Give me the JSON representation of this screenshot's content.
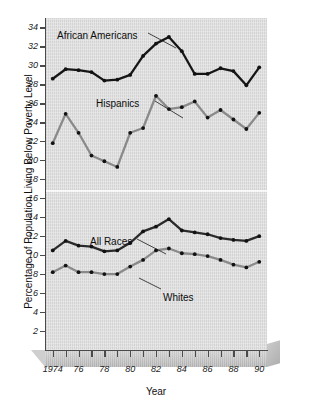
{
  "chart_data": {
    "type": "line",
    "title": "",
    "xlabel": "Year",
    "ylabel": "Percentage of Population Living Below Poverty Level",
    "x": [
      1974,
      1975,
      1976,
      1977,
      1978,
      1979,
      1980,
      1981,
      1982,
      1983,
      1984,
      1985,
      1986,
      1987,
      1988,
      1989,
      1990
    ],
    "xtick_labels": [
      "1974",
      "76",
      "78",
      "80",
      "82",
      "84",
      "86",
      "88",
      "90"
    ],
    "xtick_values": [
      1974,
      1976,
      1978,
      1980,
      1982,
      1984,
      1986,
      1988,
      1990
    ],
    "ytick_labels": [
      "2",
      "4",
      "6",
      "8",
      "10",
      "12",
      "14",
      "16",
      "18",
      "20",
      "22",
      "24",
      "26",
      "28",
      "30",
      "32",
      "34"
    ],
    "ytick_values": [
      2,
      4,
      6,
      8,
      10,
      12,
      14,
      16,
      18,
      20,
      22,
      24,
      26,
      28,
      30,
      32,
      34
    ],
    "ylim": [
      0,
      35
    ],
    "xlim": [
      1973.4,
      1990.6
    ],
    "grid": false,
    "legend_position": "inline-annotations",
    "series": [
      {
        "name": "African Americans",
        "color": "#161616",
        "values": [
          28.6,
          29.6,
          29.5,
          29.3,
          28.4,
          28.5,
          29.0,
          31.0,
          32.3,
          33.0,
          31.5,
          29.1,
          29.1,
          29.7,
          29.4,
          27.9,
          29.8
        ]
      },
      {
        "name": "Hispanics",
        "color": "#8a8a8a",
        "values": [
          21.8,
          24.9,
          22.9,
          20.5,
          19.9,
          19.3,
          22.9,
          23.4,
          26.8,
          25.4,
          25.6,
          26.2,
          24.5,
          25.3,
          24.3,
          23.3,
          25.0
        ]
      },
      {
        "name": "All Races",
        "color": "#2a2a2a",
        "values": [
          10.5,
          11.5,
          11.0,
          10.9,
          10.4,
          10.5,
          11.3,
          12.5,
          13.0,
          13.8,
          12.6,
          12.4,
          12.2,
          11.8,
          11.6,
          11.5,
          12.0
        ]
      },
      {
        "name": "Whites",
        "color": "#8a8a8a",
        "values": [
          8.2,
          8.9,
          8.2,
          8.2,
          8.0,
          8.0,
          8.8,
          9.5,
          10.5,
          10.7,
          10.2,
          10.1,
          9.9,
          9.5,
          9.0,
          8.7,
          9.3
        ]
      }
    ],
    "annotations": [
      {
        "label": "African Americans",
        "x": 57,
        "y": 30,
        "leader": true
      },
      {
        "label": "Hispanics",
        "x": 96,
        "y": 98,
        "leader": true
      },
      {
        "label": "All Races",
        "x": 90,
        "y": 236,
        "leader": true
      },
      {
        "label": "Whites",
        "x": 163,
        "y": 292,
        "leader": true
      }
    ],
    "colors": {
      "plot_background": "#dcdcdc",
      "axis": "#4a4a4a",
      "dark_series": "#161616",
      "gray_series": "#8a8a8a",
      "text": "#111111"
    }
  }
}
